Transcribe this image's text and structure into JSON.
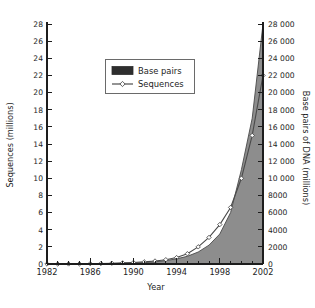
{
  "chart_data": {
    "type": "area",
    "title": "",
    "xlabel": "Year",
    "ylabel": "Sequences (millions)",
    "y2label": "Base pairs of DNA (millions)",
    "grid": false,
    "legend_position": "upper-center",
    "xlim": [
      1982,
      2002
    ],
    "xticks_major": [
      1982,
      1986,
      1990,
      1994,
      1998,
      2002
    ],
    "xtick_labels": [
      "1982",
      "1986",
      "1990",
      "1994",
      "1998",
      "2002"
    ],
    "xticks_minor": [
      1983,
      1984,
      1985,
      1987,
      1988,
      1989,
      1991,
      1992,
      1993,
      1995,
      1996,
      1997,
      1999,
      2000,
      2001
    ],
    "ylim": [
      0,
      28
    ],
    "yticks": [
      0,
      2,
      4,
      6,
      8,
      10,
      12,
      14,
      16,
      18,
      20,
      22,
      24,
      26,
      28
    ],
    "ytick_labels": [
      "0",
      "2",
      "4",
      "6",
      "8",
      "10",
      "12",
      "14",
      "16",
      "18",
      "20",
      "22",
      "24",
      "26",
      "28"
    ],
    "y2lim": [
      0,
      28000
    ],
    "y2ticks": [
      0,
      2000,
      4000,
      6000,
      8000,
      10000,
      12000,
      14000,
      16000,
      18000,
      20000,
      22000,
      24000,
      26000,
      28000
    ],
    "y2tick_labels": [
      "0",
      "2000",
      "4000",
      "6000",
      "8000",
      "10000",
      "12000",
      "14000",
      "16000",
      "18000",
      "20000",
      "22000",
      "24000",
      "26000",
      "28000"
    ],
    "x": [
      1982,
      1983,
      1984,
      1985,
      1986,
      1987,
      1988,
      1989,
      1990,
      1991,
      1992,
      1993,
      1994,
      1995,
      1996,
      1997,
      1998,
      1999,
      2000,
      2001,
      2002
    ],
    "series": [
      {
        "name": "Base pairs",
        "axis": "right",
        "units": "millions",
        "style": "filled-area",
        "color": "#8d8d8d",
        "values": [
          0,
          0,
          2,
          5,
          10,
          20,
          35,
          60,
          100,
          160,
          250,
          400,
          600,
          900,
          1400,
          2200,
          3500,
          6000,
          11000,
          17000,
          28000
        ]
      },
      {
        "name": "Sequences",
        "axis": "left",
        "units": "millions",
        "style": "line-marker",
        "color": "#3d3d3d",
        "values": [
          0,
          0,
          0.01,
          0.02,
          0.04,
          0.06,
          0.09,
          0.13,
          0.18,
          0.25,
          0.35,
          0.5,
          0.75,
          1.2,
          2.0,
          3.1,
          4.6,
          6.6,
          10.0,
          15.0,
          22.0
        ]
      }
    ],
    "legend": [
      {
        "label": "Base pairs",
        "marker": "filled-rect",
        "color": "#2e2e2e"
      },
      {
        "label": "Sequences",
        "marker": "line-diamond",
        "color": "#3d3d3d"
      }
    ]
  }
}
